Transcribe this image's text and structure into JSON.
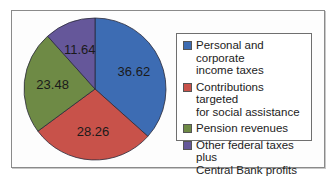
{
  "chart_data": {
    "type": "pie",
    "title": "",
    "start_angle": "12 o'clock, clockwise",
    "categories": [
      "Personal and corporate income taxes",
      "Contributions targeted for social assistance",
      "Pension revenues",
      "Other federal taxes plus Central Bank profits"
    ],
    "values": [
      36.62,
      28.26,
      23.48,
      11.64
    ],
    "colors": [
      "#3d6cb3",
      "#c8524a",
      "#6e8a45",
      "#65579a"
    ],
    "data_labels": [
      "36.62",
      "28.26",
      "23.48",
      "11.64"
    ],
    "legend_position": "right"
  },
  "legend": {
    "items": [
      {
        "label": "Personal and corporate\nincome taxes",
        "color": "#3d6cb3"
      },
      {
        "label": "Contributions targeted\nfor social assistance",
        "color": "#c8524a"
      },
      {
        "label": "Pension revenues",
        "color": "#6e8a45"
      },
      {
        "label": "Other federal taxes plus\nCentral Bank profits",
        "color": "#65579a"
      }
    ]
  }
}
